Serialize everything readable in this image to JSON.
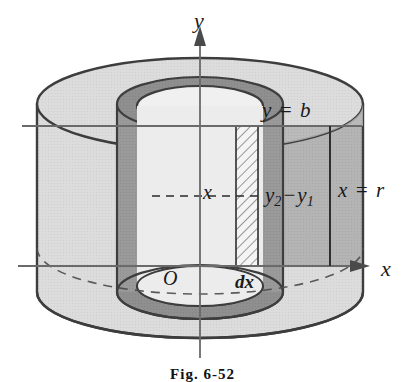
{
  "figure": {
    "caption": "Fig. 6-52",
    "axes": {
      "y_axis_label": "y",
      "x_axis_label": "x",
      "origin_label": "O"
    },
    "annotations": {
      "top_plane": "y = b",
      "outer_radius": "x = r",
      "height_difference_base": "y",
      "height_difference_sub1": "2",
      "height_difference_minus": "−",
      "height_difference_base2": "y",
      "height_difference_sub2": "1",
      "radius_variable": "x",
      "thickness": "dx"
    },
    "colors": {
      "outline": "#3d3d3d",
      "body_light": "#dcdcdc",
      "body_mid": "#b4b4b4",
      "body_dark": "#9a9a9a",
      "inner_ring": "#8f8f8f",
      "hatch_fill": "#f2f2f2",
      "axis": "#666666",
      "background": "#ffffff",
      "text": "#1a1a1a"
    },
    "geometry": {
      "center_x": 200,
      "top_ellipse_cy": 104,
      "bottom_ellipse_cy": 292,
      "outer_rx": 163,
      "outer_ry": 46,
      "inner_rx": 68,
      "inner_ry": 22,
      "shell_rx": 83,
      "shell_ry": 27,
      "y_eq_b_line_y": 126,
      "x_axis_line_y": 266,
      "shell_strip_left": 236,
      "shell_strip_right": 258
    }
  }
}
